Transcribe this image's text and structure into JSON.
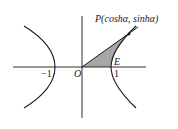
{
  "diagram": {
    "type": "hyperbola-unit",
    "curve": "x^2 - y^2 = 1",
    "labels": {
      "point": "P(coshα, sinhα)",
      "origin": "O",
      "vertex": "E",
      "one": "1",
      "minus_one": "−1"
    },
    "colors": {
      "stroke": "#1a1a1a",
      "shade": "#a6a6a6"
    }
  }
}
